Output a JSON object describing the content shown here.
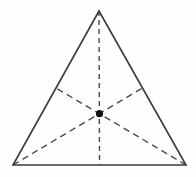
{
  "figure": {
    "background_color": "#fefefe",
    "width": 196,
    "height": 177,
    "outline_color": "#3b3b3b",
    "median_color": "#4a4a4a",
    "centroid_color": "#111111"
  },
  "chart_data": {
    "type": "diagram",
    "shape": "triangle",
    "grid": false,
    "legend": null,
    "xlabel": "",
    "ylabel": "",
    "xlim": [
      0,
      196
    ],
    "ylim": [
      0,
      177
    ],
    "vertices": [
      {
        "name": "apex",
        "x": 99,
        "y": 11
      },
      {
        "name": "bottom-left",
        "x": 13,
        "y": 165
      },
      {
        "name": "bottom-right",
        "x": 186,
        "y": 165
      }
    ],
    "midpoints": [
      {
        "name": "midpoint-left-edge",
        "x": 56,
        "y": 88
      },
      {
        "name": "midpoint-right-edge",
        "x": 142.5,
        "y": 88
      },
      {
        "name": "midpoint-base",
        "x": 99.5,
        "y": 165
      }
    ],
    "centroid": {
      "name": "centroid",
      "x": 99.5,
      "y": 113.7,
      "radius": 3.6
    },
    "outline_path": "M 99 11 L 186 165 L 13 165 Z",
    "medians": [
      {
        "name": "median-apex-to-base",
        "from": "apex",
        "to": "midpoint-base",
        "path": "M 99 11 L 99.5 165",
        "style": "dashed",
        "dash": "5 4"
      },
      {
        "name": "median-bottom-left-to-right-edge",
        "from": "bottom-left",
        "to": "midpoint-right-edge",
        "path": "M 13 165 L 142.5 88",
        "style": "dashed",
        "dash": "6.5 4.5"
      },
      {
        "name": "median-bottom-right-to-left-edge",
        "from": "bottom-right",
        "to": "midpoint-left-edge",
        "path": "M 186 165 L 56 88",
        "style": "dashed",
        "dash": "6.5 4.5"
      }
    ],
    "labels": []
  }
}
